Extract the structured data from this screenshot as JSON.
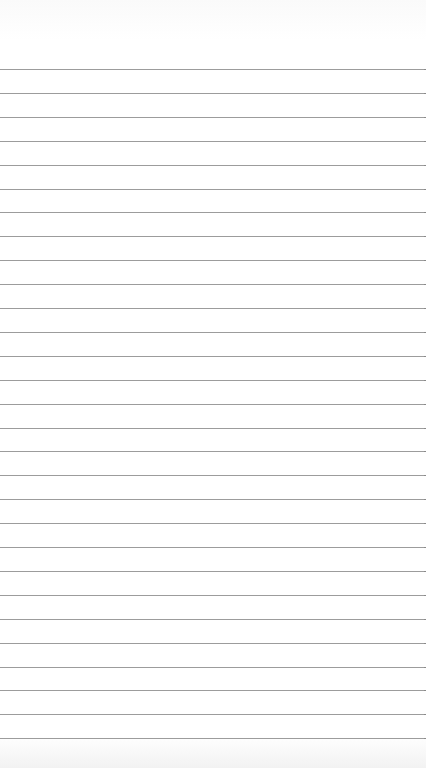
{
  "page": {
    "type": "lined-paper",
    "background_color": "#ffffff",
    "line_color": "#9c9c9c",
    "first_line_y": 69,
    "line_spacing": 23.9,
    "line_count": 29
  }
}
